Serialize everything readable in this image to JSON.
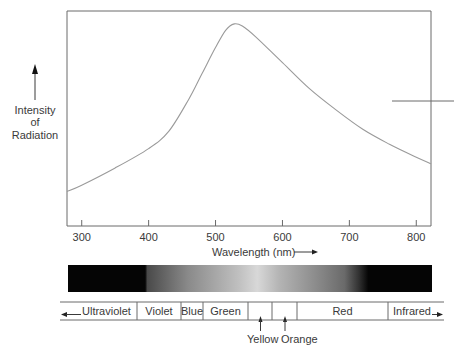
{
  "chart_data": {
    "type": "line",
    "title": "",
    "xlabel": "Wavelength (nm)",
    "ylabel": "Intensity of Radiation",
    "ylabel_lines": [
      "Intensity",
      "of",
      "Radiation"
    ],
    "xlim": [
      278,
      822
    ],
    "ylim": [
      0,
      1
    ],
    "x_ticks": [
      300,
      400,
      500,
      600,
      700,
      800
    ],
    "x_tick_labels": [
      "300",
      "400",
      "500",
      "600",
      "700",
      "800"
    ],
    "grid": false,
    "legend": null,
    "series": [
      {
        "name": "Intensity of Radiation",
        "x": [
          278,
          300,
          350,
          400,
          430,
          460,
          480,
          500,
          515,
          528,
          540,
          560,
          600,
          640,
          680,
          720,
          760,
          800,
          822
        ],
        "y": [
          0.16,
          0.19,
          0.27,
          0.36,
          0.44,
          0.59,
          0.71,
          0.83,
          0.91,
          0.94,
          0.93,
          0.88,
          0.76,
          0.64,
          0.54,
          0.45,
          0.38,
          0.32,
          0.29
        ]
      }
    ],
    "annotations": [
      "Horizontal reference mark crossing right axis near 0.65 intensity"
    ]
  },
  "axis": {
    "x_label": "Wavelength (nm)",
    "x_ticks": [
      "300",
      "400",
      "500",
      "600",
      "700",
      "800"
    ],
    "y_label_lines": [
      "Intensity",
      "of",
      "Radiation"
    ]
  },
  "spectrum_bar": {
    "colors": {
      "dark": "#050505",
      "mid": "#6e6e6e",
      "light": "#d6d6d6"
    }
  },
  "bands": [
    {
      "label": "Ultraviolet",
      "arrow": "left"
    },
    {
      "label": "Violet"
    },
    {
      "label": "Blue"
    },
    {
      "label": "Green"
    },
    {
      "label": ""
    },
    {
      "label": ""
    },
    {
      "label": "Red"
    },
    {
      "label": "Infrared",
      "arrow": "right"
    }
  ],
  "callouts": {
    "yellow": "Yellow",
    "orange": "Orange"
  }
}
